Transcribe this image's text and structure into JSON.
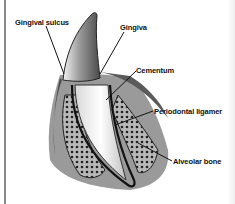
{
  "diagram": {
    "labels": [
      {
        "id": "gingival-sulcus",
        "text": "Gingival sulcus"
      },
      {
        "id": "gingiva",
        "text": "Gingiva"
      },
      {
        "id": "cementum",
        "text": "Cementum"
      },
      {
        "id": "periodontal-ligament",
        "text": "Periodontal ligamer"
      },
      {
        "id": "alveolar-bone",
        "text": "Alveolar bone"
      }
    ]
  },
  "colors": {
    "background": "#ffffff",
    "ink": "#111111",
    "tissue_dark": "#3a3a3a",
    "tissue_mid": "#8c8c8c",
    "tissue_light": "#cfcfcf",
    "enamel": "#e6e6e6"
  }
}
